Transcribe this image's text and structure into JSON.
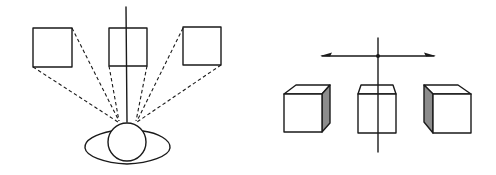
{
  "figure": {
    "left_panel": {
      "label": "viewer-with-sight-lines",
      "objects": [
        "square-left",
        "square-center",
        "square-right"
      ],
      "viewer": "head-and-shoulders-top-view"
    },
    "right_panel": {
      "label": "cubes-in-perspective",
      "objects": [
        "cube-left",
        "cube-center",
        "cube-right"
      ],
      "axis": "horizontal-double-arrow-with-vertical-line"
    },
    "colors": {
      "ink": "#1a1a1a",
      "shade": "#8c8c8c",
      "background": "#ffffff"
    }
  }
}
